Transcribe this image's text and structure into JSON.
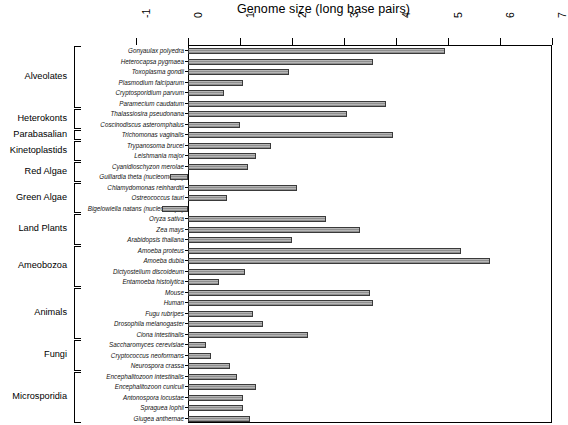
{
  "chart_data": {
    "type": "bar",
    "orientation": "horizontal",
    "title": "Genome size (long base pairs)",
    "xlabel": "Genome size (long base pairs)",
    "ylabel": "",
    "xlim": [
      -1,
      7
    ],
    "xticks": [
      -1,
      0,
      1,
      2,
      3,
      4,
      5,
      6,
      7
    ],
    "xtick_labels": [
      "-1",
      "0",
      "1",
      "2",
      "3",
      "4",
      "5",
      "6",
      "7"
    ],
    "grid": false,
    "legend": "none",
    "categories": [
      "Gonyaulax polyedra",
      "Heterocapsa pygmaea",
      "Toxoplasma gondii",
      "Plasmodium falciparum",
      "Cryptosporidium parvum",
      "Paramecium caudatum",
      "Thalassiosira pseudonana",
      "Coscinodiscus asteromphalus",
      "Trichomonas vaginalis",
      "Trypanosoma brucei",
      "Leishmania major",
      "Cyanidioschyzon merolae",
      "Guillardia theta (nucleomorph)",
      "Chlamydomonas reinhardtii",
      "Ostreococcus tauri",
      "Bigelowiella natans (nucleomorph)",
      "Oryza sativa",
      "Zea mays",
      "Arabidopsis thaliana",
      "Amoeba proteus",
      "Amoeba dubia",
      "Dictyostelium discoideum",
      "Entamoeba histolytica",
      "Mouse",
      "Human",
      "Fugu rubripes",
      "Drosophila melanogaster",
      "Ciona intestinalis",
      "Saccharomyces cerevisiae",
      "Cryptococcus neoformans",
      "Neurospora crassa",
      "Encephalitozoon intestinalis",
      "Encephalitozoon cuniculi",
      "Antonospora locustae",
      "Spraguea lophii",
      "Glugea anthernae"
    ],
    "values": [
      4.95,
      3.55,
      1.95,
      1.05,
      0.7,
      3.8,
      3.05,
      1.0,
      3.95,
      1.6,
      1.3,
      1.15,
      -0.35,
      2.1,
      0.75,
      -0.5,
      2.65,
      3.3,
      2.0,
      5.25,
      5.8,
      1.1,
      0.6,
      3.5,
      3.55,
      1.25,
      1.45,
      2.3,
      0.35,
      0.45,
      0.8,
      0.95,
      1.3,
      1.05,
      1.05,
      1.2
    ],
    "groups": [
      {
        "label": "Alveolates",
        "start": 0,
        "end": 5
      },
      {
        "label": "Heterokonts",
        "start": 6,
        "end": 7
      },
      {
        "label": "Parabasalian",
        "start": 8,
        "end": 8
      },
      {
        "label": "Kinetoplastids",
        "start": 9,
        "end": 10
      },
      {
        "label": "Red Algae",
        "start": 11,
        "end": 12
      },
      {
        "label": "Green Algae",
        "start": 13,
        "end": 15
      },
      {
        "label": "Land Plants",
        "start": 16,
        "end": 18
      },
      {
        "label": "Ameobozoa",
        "start": 19,
        "end": 22
      },
      {
        "label": "Animals",
        "start": 23,
        "end": 27
      },
      {
        "label": "Fungi",
        "start": 28,
        "end": 30
      },
      {
        "label": "Microsporidia",
        "start": 31,
        "end": 35
      }
    ],
    "bar_color": "#a6a6a6",
    "bar_edge_color": "#3a3a3a"
  }
}
